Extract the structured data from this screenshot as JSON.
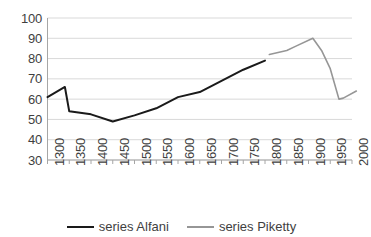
{
  "chart_data": {
    "type": "line",
    "title": "",
    "xlabel": "",
    "ylabel": "",
    "xlim": [
      1300,
      2000
    ],
    "ylim": [
      30,
      100
    ],
    "grid": true,
    "legend_position": "bottom-center",
    "y_ticks": [
      100,
      90,
      80,
      70,
      60,
      50,
      40,
      30
    ],
    "x_ticks": [
      1300,
      1350,
      1400,
      1450,
      1500,
      1550,
      1600,
      1650,
      1700,
      1750,
      1800,
      1850,
      1900,
      1950,
      2000
    ],
    "series": [
      {
        "name": "series Alfani",
        "color": "#1a1a1a",
        "x": [
          1300,
          1340,
          1350,
          1400,
          1450,
          1500,
          1550,
          1600,
          1650,
          1700,
          1750,
          1800
        ],
        "values": [
          61,
          66,
          54,
          52.5,
          49,
          52,
          55.5,
          61,
          63.5,
          69,
          74.5,
          79
        ]
      },
      {
        "name": "series Piketty",
        "color": "#969696",
        "x": [
          1810,
          1850,
          1870,
          1910,
          1930,
          1950,
          1970,
          1980,
          2010
        ],
        "values": [
          82,
          84,
          86,
          90,
          84,
          75,
          60,
          60.5,
          64
        ]
      }
    ]
  },
  "legend": {
    "items": [
      {
        "label": "series Alfani",
        "color": "#1a1a1a",
        "width": "2.6px"
      },
      {
        "label": "series Piketty",
        "color": "#969696",
        "width": "2.2px"
      }
    ]
  },
  "axes": {
    "y_tick_labels": [
      "100",
      "90",
      "80",
      "70",
      "60",
      "50",
      "40",
      "30"
    ],
    "x_tick_labels": [
      "1300",
      "1350",
      "1400",
      "1450",
      "1500",
      "1550",
      "1600",
      "1650",
      "1700",
      "1750",
      "1800",
      "1850",
      "1900",
      "1950",
      "2000"
    ]
  },
  "colors": {
    "gridline": "#d9d9d9",
    "axis": "#a6a6a6",
    "text": "#3f3f3f",
    "background": "#ffffff"
  }
}
